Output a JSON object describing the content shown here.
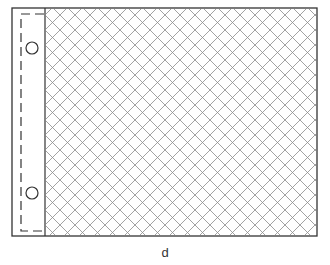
{
  "figure": {
    "caption": "d",
    "elements": {
      "frame": "outer-rectangle",
      "margin_strip": {
        "holes": 2,
        "border": "dashed"
      },
      "hatch_area": {
        "pattern": "diagonal-crosshatch"
      }
    },
    "colors": {
      "line": "#333333",
      "hatch": "#888888",
      "background": "#ffffff"
    }
  }
}
